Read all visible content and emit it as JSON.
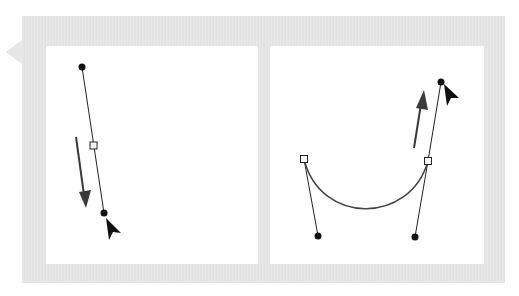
{
  "diagram": {
    "title": "",
    "frame_color": "#e6e6e6",
    "panels": [
      {
        "name": "left-panel",
        "description": "Dragging a direction point downward along a straight handle",
        "anchor_point": {
          "x": 93,
          "y": 145,
          "shape": "hollow-square"
        },
        "direction_points": [
          {
            "x": 82,
            "y": 67,
            "shape": "filled-circle"
          },
          {
            "x": 104,
            "y": 213,
            "shape": "filled-circle"
          }
        ],
        "drag_arrow": {
          "from": [
            76,
            137
          ],
          "to": [
            86,
            208
          ],
          "direction": "down"
        },
        "cursor": {
          "x": 106,
          "y": 222,
          "icon": "arrow-cursor"
        }
      },
      {
        "name": "right-panel",
        "description": "Dragging a direction point upward to shape a curve",
        "anchor_points": [
          {
            "x": 304,
            "y": 159,
            "shape": "hollow-square"
          },
          {
            "x": 428,
            "y": 161,
            "shape": "hollow-square"
          }
        ],
        "direction_points": [
          {
            "x": 318,
            "y": 236,
            "shape": "filled-circle"
          },
          {
            "x": 415,
            "y": 237,
            "shape": "filled-circle"
          },
          {
            "x": 441,
            "y": 82,
            "shape": "filled-circle"
          }
        ],
        "curve": "M304 159 C320 225 410 225 428 161",
        "drag_arrow": {
          "from": [
            414,
            148
          ],
          "to": [
            424,
            92
          ],
          "direction": "up"
        },
        "cursor": {
          "x": 444,
          "y": 87,
          "icon": "arrow-cursor"
        }
      }
    ],
    "colors": {
      "stroke": "#222222",
      "arrow": "#3a3a3a",
      "curve": "#444444"
    }
  }
}
